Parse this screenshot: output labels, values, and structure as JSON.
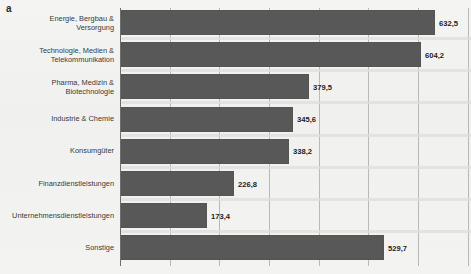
{
  "panel": {
    "label": "a"
  },
  "chart_data": {
    "type": "bar",
    "orientation": "horizontal",
    "title": "",
    "subtitle": "",
    "xlabel": "",
    "ylabel": "",
    "grid": true,
    "legend": "none",
    "xlim": [
      0,
      700
    ],
    "gridline_step": 100,
    "decimal_separator": ",",
    "categories": [
      "Energie, Bergbau & Versorgung",
      "Technologie, Medien & Telekommunikation",
      "Pharma, Medizin & Biotechnologie",
      "Industrie & Chemie",
      "Konsumgüter",
      "Finanzdienstleistungen",
      "Unternehmensdienstleistungen",
      "Sonstige"
    ],
    "values": [
      632.5,
      604.2,
      379.5,
      345.6,
      338.2,
      226.8,
      173.4,
      529.7
    ],
    "value_labels": [
      "632,5",
      "604,2",
      "379,5",
      "345,6",
      "338,2",
      "226,8",
      "173,4",
      "529,7"
    ],
    "bars": [
      {
        "category_line1": "Energie, Bergbau &",
        "category_line2": "Versorgung",
        "value": 632.5,
        "label": "632,5"
      },
      {
        "category_line1": "Technologie, Medien &",
        "category_line2": "Telekommunikation",
        "value": 604.2,
        "label": "604,2"
      },
      {
        "category_line1": "Pharma, Medizin &",
        "category_line2": "Biotechnologie",
        "value": 379.5,
        "label": "379,5"
      },
      {
        "category_line1": "Industrie & Chemie",
        "category_line2": "",
        "value": 345.6,
        "label": "345,6"
      },
      {
        "category_line1": "Konsumgüter",
        "category_line2": "",
        "value": 338.2,
        "label": "338,2"
      },
      {
        "category_line1": "Finanzdienstleistungen",
        "category_line2": "",
        "value": 226.8,
        "label": "226,8"
      },
      {
        "category_line1": "Unternehmensdienstleistungen",
        "category_line2": "",
        "value": 173.4,
        "label": "173,4"
      },
      {
        "category_line1": "Sonstige",
        "category_line2": "",
        "value": 529.7,
        "label": "529,7"
      }
    ],
    "colors": {
      "bar": "#585858",
      "gridline": "#b9b9b7",
      "axis": "#6e6e6c",
      "background": "#f2f2f0",
      "text": "#3a3a3a",
      "value_text": "#1e1e1e"
    }
  }
}
